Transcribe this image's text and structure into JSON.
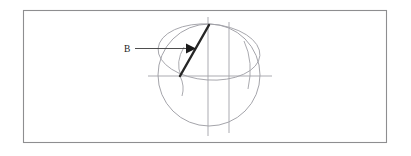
{
  "figure": {
    "title": "",
    "caption": "",
    "background_color": "#ffffff",
    "frame": {
      "name": "figure-border",
      "x": 23,
      "y": 10,
      "width": 364,
      "height": 133,
      "stroke_color": "#8e8e90"
    },
    "labels": [
      {
        "id": "vector-label-b",
        "text": "B",
        "x": 126,
        "y": 51
      }
    ],
    "leader": {
      "name": "leader-arrow",
      "from_x": 134,
      "from_y": 48,
      "to_x": 193,
      "to_y": 48,
      "color": "#1a1a1a"
    },
    "sphere": {
      "name": "sphere-outline",
      "center_x": 209,
      "center_y": 75,
      "radius": 51,
      "stroke_color": "#9a9aa0"
    },
    "great_circle": {
      "name": "great-circle-ellipse",
      "center_x": 209,
      "center_y": 52,
      "rx": 51,
      "ry": 28,
      "rotation_deg": 4,
      "stroke_color": "#a0a0a6"
    },
    "axes": [
      {
        "id": "polar-axis",
        "orientation": "vertical",
        "x1": 208,
        "y1": 17,
        "x2": 208,
        "y2": 136
      },
      {
        "id": "secondary-axis",
        "orientation": "vertical",
        "x1": 229,
        "y1": 22,
        "x2": 229,
        "y2": 133
      },
      {
        "id": "equatorial-axis",
        "orientation": "horizontal",
        "x1": 148,
        "y1": 76,
        "x2": 272,
        "y2": 76
      }
    ],
    "meridians": [
      {
        "id": "left-meridian-arc",
        "path": "M 181 76 Q 176 62 183 48"
      },
      {
        "id": "lower-left-meridian-arc",
        "path": "M 180 76 Q 184 86 182 95"
      },
      {
        "id": "right-meridian-arc",
        "path": "M 245 42 Q 253 62 249 88"
      }
    ],
    "vector": {
      "name": "magnetic-field-vector",
      "symbol": "B",
      "tail_x": 180,
      "tail_y": 76,
      "head_x": 209,
      "head_y": 25,
      "color": "#262626"
    }
  }
}
